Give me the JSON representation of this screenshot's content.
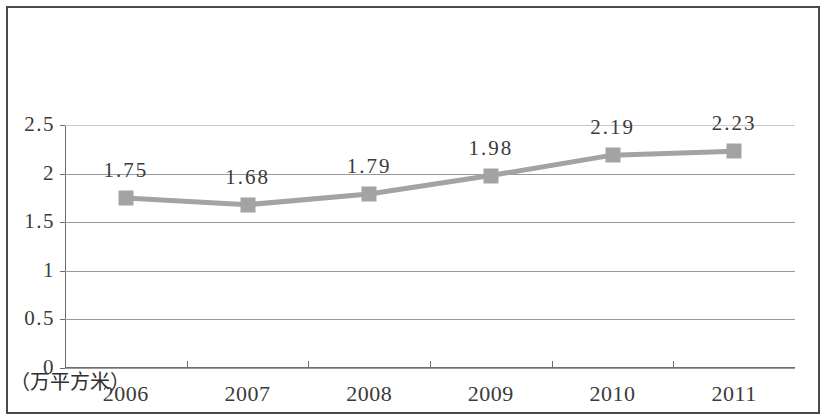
{
  "chart_data": {
    "type": "line",
    "title": "",
    "xlabel": "",
    "ylabel": "",
    "unit_label": "（万平方米）",
    "categories": [
      "2006",
      "2007",
      "2008",
      "2009",
      "2010",
      "2011"
    ],
    "values": [
      1.75,
      1.68,
      1.79,
      1.98,
      2.19,
      2.23
    ],
    "data_labels": [
      "1.75",
      "1.68",
      "1.79",
      "1.98",
      "2.19",
      "2.23"
    ],
    "ylim": [
      0,
      2.5
    ],
    "ytick_labels": [
      "0",
      "0.5",
      "1",
      "1.5",
      "2",
      "2.5"
    ],
    "ytick_values": [
      0,
      0.5,
      1,
      1.5,
      2,
      2.5
    ],
    "grid": true,
    "legend": "none",
    "series": [
      {
        "name": "",
        "values": [
          1.75,
          1.68,
          1.79,
          1.98,
          2.19,
          2.23
        ],
        "line_color": "#a3a3a3",
        "marker_color": "#a3a3a3",
        "marker_shape": "square"
      }
    ],
    "colors": {
      "line": "#a3a3a3",
      "marker": "#a3a3a3",
      "grid": "#9a9a9a",
      "axis": "#6d6d6d",
      "text": "#3a3a3a",
      "frame": "#4a4a4a",
      "background": "#ffffff"
    }
  }
}
